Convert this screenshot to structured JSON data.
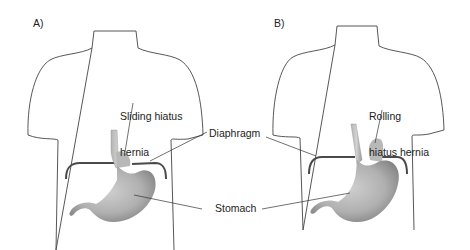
{
  "panels": [
    {
      "id": "A",
      "label": "A)",
      "hernia_label_line1": "Sliding hiatus",
      "hernia_label_line2": "hernia"
    },
    {
      "id": "B",
      "label": "B)",
      "hernia_label_line1": "Rolling",
      "hernia_label_line2": "hiatus hernia"
    }
  ],
  "shared_labels": {
    "diaphragm": "Diaphragm",
    "stomach": "Stomach"
  },
  "colors": {
    "outline": "#444444",
    "diaphragm": "#4a4a4a",
    "stomach_light": "#c8c8c8",
    "stomach_dark": "#8a8a8a",
    "leader": "#333333"
  }
}
